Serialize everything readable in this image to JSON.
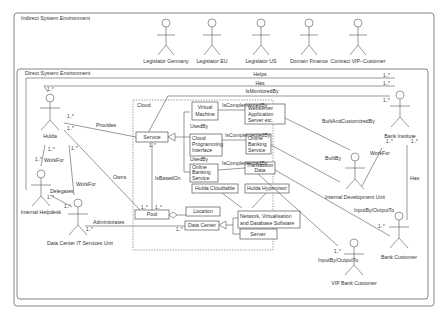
{
  "frames": {
    "indirect": "Indirect System Environment",
    "direct": "Direct System Environment",
    "cloud": "Cloud"
  },
  "actors": {
    "legislator_germany": "Legislator Germany",
    "legislator_eu": "Legislator EU",
    "legislator_us": "Legislator US",
    "domain_finance": "Domain Finance",
    "contract_vip": "Contract VIP–Customer",
    "hulda": "Hulda",
    "internal_helpdesk": "Internal Helpdesk",
    "dc_it": "Data Center IT Services Unit",
    "bank_institute": "Bank Institute",
    "internal_dev": "Internal Development Unit",
    "bank_customer": "Bank Customer",
    "vip_bank_customer": "VIP Bank Customer"
  },
  "classes": {
    "service": "Service",
    "virtual_machine": [
      "Virtual",
      "Machine"
    ],
    "cloud_pi": [
      "Cloud",
      "Programming",
      "Interface"
    ],
    "online_banking_service_left": [
      "Online",
      "Banking",
      "Service"
    ],
    "webserver": [
      "Webserver",
      "Application",
      "Server etc."
    ],
    "online_banking_service_right": [
      "Online",
      "Banking",
      "Service"
    ],
    "transaction_data": [
      "Transaction",
      "Data"
    ],
    "hulda_cloudtable": "Hulda Cloudtable",
    "hulda_hypervisor": "Hulda Hypervisor",
    "pool": "Pool",
    "location": "Location",
    "data_center": "Data Center",
    "network": [
      "Network, Virtualisation",
      "and Database Software"
    ],
    "server": "Server"
  },
  "associations": {
    "helps": "Helps",
    "has_top": "Has",
    "is_monitored_by": "IsMonitoredBy",
    "provides": "Provides",
    "work_for_1": "WorkFor",
    "work_for_2": "WorkFor",
    "work_for_3": "WorkFor",
    "delegates": "Delegates",
    "owns": "Owns",
    "is_based_on": "IsBasedOn",
    "administrates": "Administrates",
    "used_by_1": "UsedBy",
    "used_by_2": "UsedBy",
    "used_by_3": "UsedBy",
    "is_complemented_by_1": "IsComplementedBy",
    "is_complemented_by_2": "IsComplementedBy",
    "is_complemented_by_3": "IsComplementedBy",
    "built_and_customized_by": "BuiltAndCustomizedBy",
    "built_by": "BuiltBy",
    "has_right": "Has",
    "input_by_1": "InputBy/OutputTo",
    "input_by_2": "InputBy/OutputTo"
  },
  "multiplicity": "1..*"
}
